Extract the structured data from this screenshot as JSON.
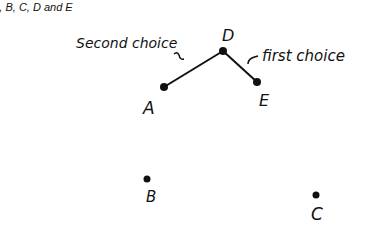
{
  "caption": "A, B, C, D and E",
  "diagram": {
    "points": [
      {
        "id": "A",
        "label": "A",
        "x": 164,
        "y": 87,
        "lx": 143,
        "ly": 114
      },
      {
        "id": "B",
        "label": "B",
        "x": 147,
        "y": 179,
        "lx": 146,
        "ly": 202
      },
      {
        "id": "C",
        "label": "C",
        "x": 316,
        "y": 195,
        "lx": 311,
        "ly": 219
      },
      {
        "id": "D",
        "label": "D",
        "x": 223,
        "y": 51,
        "lx": 222,
        "ly": 41
      },
      {
        "id": "E",
        "label": "E",
        "x": 257,
        "y": 82,
        "lx": 259,
        "ly": 105
      }
    ],
    "edges": [
      {
        "from": "D",
        "to": "A",
        "annotation": "Second choice"
      },
      {
        "from": "D",
        "to": "E",
        "annotation": "first choice"
      }
    ],
    "annotations": {
      "second_choice": "Second choice",
      "first_choice": "first choice"
    },
    "line_color": "#111111"
  }
}
